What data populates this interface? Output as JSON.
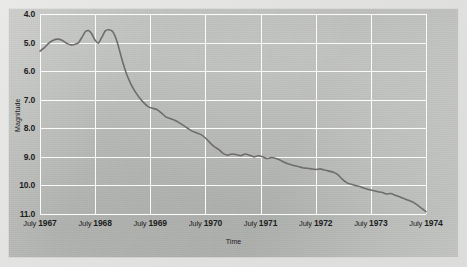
{
  "chart_data": {
    "type": "line",
    "title": "",
    "xlabel": "Time",
    "ylabel": "Magnitude",
    "grid": true,
    "legend": false,
    "y_axis_inverted": true,
    "ylim": [
      4.0,
      11.0
    ],
    "yticks": [
      "4.0",
      "5.0",
      "6.0",
      "7.0",
      "8.0",
      "9.0",
      "10.0",
      "11.0"
    ],
    "ytick_values": [
      4.0,
      5.0,
      6.0,
      7.0,
      8.0,
      9.0,
      10.0,
      11.0
    ],
    "xlim": [
      "July 1967",
      "July 1974"
    ],
    "xticks": [
      "July 1967",
      "July 1968",
      "July 1969",
      "July 1970",
      "July 1971",
      "July 1972",
      "July 1973",
      "July 1974"
    ],
    "xtick_values": [
      1967.5,
      1968.5,
      1969.5,
      1970.5,
      1971.5,
      1972.5,
      1973.5,
      1974.5
    ],
    "line_color": "#6d6d6d",
    "series": [
      {
        "name": "Magnitude",
        "x": [
          1967.5,
          1967.58,
          1967.66,
          1967.74,
          1967.82,
          1967.9,
          1967.98,
          1968.06,
          1968.14,
          1968.2,
          1968.26,
          1968.32,
          1968.38,
          1968.44,
          1968.5,
          1968.56,
          1968.62,
          1968.68,
          1968.74,
          1968.82,
          1968.9,
          1968.98,
          1969.06,
          1969.14,
          1969.22,
          1969.3,
          1969.38,
          1969.46,
          1969.54,
          1969.62,
          1969.7,
          1969.78,
          1969.86,
          1969.94,
          1970.02,
          1970.1,
          1970.18,
          1970.26,
          1970.34,
          1970.42,
          1970.5,
          1970.58,
          1970.66,
          1970.74,
          1970.82,
          1970.9,
          1970.98,
          1971.06,
          1971.14,
          1971.22,
          1971.3,
          1971.38,
          1971.46,
          1971.54,
          1971.62,
          1971.7,
          1971.78,
          1971.86,
          1971.94,
          1972.02,
          1972.1,
          1972.18,
          1972.26,
          1972.34,
          1972.42,
          1972.5,
          1972.58,
          1972.66,
          1972.74,
          1972.82,
          1972.9,
          1972.98,
          1973.06,
          1973.14,
          1973.22,
          1973.3,
          1973.38,
          1973.46,
          1973.54,
          1973.62,
          1973.7,
          1973.78,
          1973.86,
          1973.94,
          1974.02,
          1974.1,
          1974.18,
          1974.26,
          1974.34,
          1974.42,
          1974.5
        ],
        "values": [
          5.3,
          5.18,
          5.02,
          4.92,
          4.88,
          4.92,
          5.02,
          5.08,
          5.06,
          5.0,
          4.82,
          4.62,
          4.58,
          4.7,
          4.92,
          5.02,
          4.82,
          4.6,
          4.55,
          4.62,
          4.98,
          5.55,
          6.05,
          6.42,
          6.7,
          6.92,
          7.1,
          7.24,
          7.3,
          7.34,
          7.46,
          7.6,
          7.66,
          7.72,
          7.8,
          7.9,
          8.0,
          8.1,
          8.16,
          8.22,
          8.34,
          8.5,
          8.64,
          8.74,
          8.88,
          8.94,
          8.9,
          8.92,
          8.96,
          8.9,
          8.94,
          9.0,
          8.96,
          9.0,
          9.06,
          9.02,
          9.06,
          9.12,
          9.2,
          9.26,
          9.3,
          9.34,
          9.38,
          9.4,
          9.42,
          9.44,
          9.42,
          9.46,
          9.5,
          9.54,
          9.62,
          9.78,
          9.9,
          9.96,
          10.0,
          10.04,
          10.1,
          10.14,
          10.18,
          10.22,
          10.24,
          10.3,
          10.28,
          10.34,
          10.4,
          10.46,
          10.52,
          10.58,
          10.68,
          10.8,
          10.92
        ]
      }
    ]
  }
}
